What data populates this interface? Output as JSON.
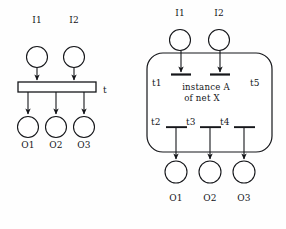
{
  "figure": {
    "background_color": "#fefefe",
    "stroke_color": "#15161a",
    "fill_color": "#ffffff"
  },
  "left_net": {
    "inputs": [
      {
        "label": "I1",
        "cx": 37,
        "cy": 57,
        "r": 10.5,
        "label_x": 37,
        "label_y": 22
      },
      {
        "label": "I2",
        "cx": 74,
        "cy": 57,
        "r": 10.5,
        "label_x": 74,
        "label_y": 22
      }
    ],
    "transition": {
      "label": "t",
      "x": 18,
      "y": 82,
      "width": 78,
      "height": 10,
      "label_x": 104,
      "label_y": 91
    },
    "outputs": [
      {
        "label": "O1",
        "cx": 28,
        "cy": 127,
        "r": 10.5,
        "label_x": 28,
        "label_y": 146
      },
      {
        "label": "O2",
        "cx": 56,
        "cy": 127,
        "r": 10.5,
        "label_x": 56,
        "label_y": 146
      },
      {
        "label": "O3",
        "cx": 84,
        "cy": 127,
        "r": 10.5,
        "label_x": 84,
        "label_y": 146
      }
    ]
  },
  "right_net": {
    "inputs": [
      {
        "label": "I1",
        "cx": 180,
        "cy": 40,
        "r": 10.5,
        "label_x": 180,
        "label_y": 15
      },
      {
        "label": "I2",
        "cx": 219,
        "cy": 40,
        "r": 10.5,
        "label_x": 219,
        "label_y": 15
      }
    ],
    "subnet_box": {
      "caption_line1": "instance A",
      "caption_line2": "of net X",
      "x": 147,
      "y": 53,
      "width": 125,
      "height": 99,
      "radius": 16,
      "caption_cx": 206,
      "caption_y": 86
    },
    "input_transitions": [
      {
        "label": "t1",
        "bar_x": 171,
        "bar_y": 74,
        "bar_w": 20,
        "label_x": 156,
        "label_y": 85
      },
      {
        "label": "t5",
        "bar_x": 210,
        "bar_y": 74,
        "bar_w": 20,
        "label_x": 254,
        "label_y": 85
      }
    ],
    "output_transitions": [
      {
        "label": "t2",
        "bar_x": 166,
        "bar_y": 127,
        "bar_w": 20,
        "label_x": 153,
        "label_y": 125
      },
      {
        "label": "t3",
        "bar_x": 200,
        "bar_y": 127,
        "bar_w": 20,
        "label_x": 188,
        "label_y": 125
      },
      {
        "label": "t4",
        "bar_x": 234,
        "bar_y": 127,
        "bar_w": 20,
        "label_x": 222,
        "label_y": 125
      }
    ],
    "outputs": [
      {
        "label": "O1",
        "cx": 176,
        "cy": 172,
        "r": 11,
        "label_x": 176,
        "label_y": 200
      },
      {
        "label": "O2",
        "cx": 210,
        "cy": 172,
        "r": 11,
        "label_x": 210,
        "label_y": 200
      },
      {
        "label": "O3",
        "cx": 244,
        "cy": 172,
        "r": 11,
        "label_x": 244,
        "label_y": 200
      }
    ]
  }
}
